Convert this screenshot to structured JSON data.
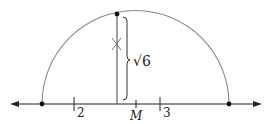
{
  "diagram": {
    "type": "geometric construction",
    "labels": {
      "tick_2": "2",
      "tick_3": "3",
      "midpoint": "M",
      "length": "√6"
    },
    "colors": {
      "line": "#222222",
      "arc": "#888888"
    }
  }
}
